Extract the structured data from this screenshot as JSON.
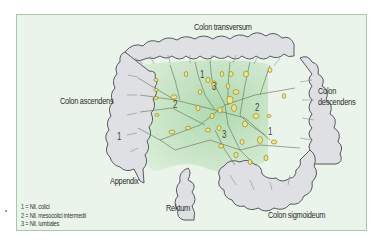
{
  "diagram": {
    "labels": {
      "colon_transversum": "Colon transversum",
      "colon_ascendens": "Colon ascendens",
      "colon_descendens_line1": "Colon",
      "colon_descendens_line2": "descendens",
      "appendix": "Appendix",
      "rektum": "Rektum",
      "colon_sigmoideum": "Colon sigmoideum"
    },
    "node_numbers": [
      {
        "id": "n1a",
        "text": "1"
      },
      {
        "id": "n1b",
        "text": "1"
      },
      {
        "id": "n1c",
        "text": "1"
      },
      {
        "id": "n2a",
        "text": "2"
      },
      {
        "id": "n2b",
        "text": "2"
      },
      {
        "id": "n3a",
        "text": "3"
      },
      {
        "id": "n3b",
        "text": "3"
      }
    ],
    "legend": [
      {
        "key": "1",
        "text": "1 = Nll. colici"
      },
      {
        "key": "2",
        "text": "2 = Nll. mesocolici intermedii"
      },
      {
        "key": "3",
        "text": "3 = Nll. lumbales"
      }
    ],
    "colors": {
      "background": "#eaf4ea",
      "frame_border": "#a9c7a9",
      "colon_fill": "#dfe0e4",
      "colon_stroke": "#55595f",
      "mesentery_fill": "#b9ddb8",
      "lymph_node_fill": "#f1e487",
      "lymph_node_stroke": "#8a7a20",
      "vessel_stroke": "#5f6f55"
    }
  }
}
